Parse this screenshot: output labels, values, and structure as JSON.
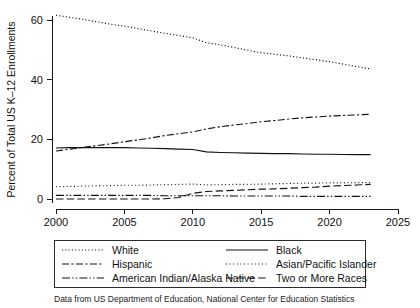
{
  "chart_data": {
    "type": "line",
    "title": "",
    "xlabel": "Year",
    "ylabel": "Percent of Total US K–12 Enrollments",
    "xlim": [
      2000,
      2025
    ],
    "ylim": [
      0,
      63
    ],
    "xticks": [
      2000,
      2005,
      2010,
      2015,
      2020,
      2025
    ],
    "yticks": [
      0,
      20,
      40,
      60
    ],
    "grid": false,
    "legend_position": "bottom",
    "caption": "Data from US Department of Education, National Center for Education Statistics",
    "x": [
      2000,
      2001,
      2002,
      2003,
      2004,
      2005,
      2006,
      2007,
      2008,
      2009,
      2010,
      2011,
      2012,
      2013,
      2014,
      2015,
      2016,
      2017,
      2018,
      2019,
      2020,
      2021,
      2022,
      2023
    ],
    "series": [
      {
        "name": "White",
        "dash": "dotted",
        "values": [
          61.6,
          60.9,
          60.2,
          59.4,
          58.6,
          57.9,
          57.1,
          56.3,
          55.5,
          54.8,
          54.0,
          52.4,
          51.7,
          50.8,
          49.9,
          49.0,
          48.5,
          48.0,
          47.3,
          46.7,
          46.0,
          45.2,
          44.4,
          43.6
        ]
      },
      {
        "name": "Hispanic",
        "dash": "dash-dot",
        "values": [
          16.1,
          16.7,
          17.3,
          17.9,
          18.5,
          19.2,
          19.8,
          20.5,
          21.3,
          21.9,
          22.5,
          23.5,
          24.2,
          24.8,
          25.3,
          25.9,
          26.3,
          26.8,
          27.2,
          27.5,
          27.8,
          28.0,
          28.2,
          28.4
        ]
      },
      {
        "name": "Black",
        "dash": "solid",
        "values": [
          17.1,
          17.2,
          17.2,
          17.2,
          17.2,
          17.2,
          17.1,
          17.0,
          16.9,
          16.7,
          16.6,
          15.8,
          15.6,
          15.5,
          15.4,
          15.3,
          15.2,
          15.2,
          15.1,
          15.0,
          15.0,
          14.9,
          14.9,
          14.9
        ]
      },
      {
        "name": "Asian/Pacific Islander",
        "dash": "fine-dotted",
        "values": [
          4.1,
          4.2,
          4.3,
          4.4,
          4.5,
          4.6,
          4.6,
          4.7,
          4.8,
          4.9,
          5.0,
          4.7,
          4.8,
          4.9,
          4.9,
          5.0,
          5.1,
          5.2,
          5.3,
          5.3,
          5.4,
          5.4,
          5.5,
          5.5
        ]
      },
      {
        "name": "American Indian/Alaska Native",
        "dash": "dash-dot-dot",
        "values": [
          1.2,
          1.2,
          1.2,
          1.2,
          1.2,
          1.2,
          1.2,
          1.2,
          1.1,
          1.1,
          1.1,
          1.1,
          1.1,
          1.0,
          1.0,
          1.0,
          1.0,
          1.0,
          0.9,
          0.9,
          0.9,
          0.9,
          0.9,
          0.9
        ]
      },
      {
        "name": "Two or More Races",
        "dash": "long-dash",
        "values": [
          0.0,
          0.0,
          0.0,
          0.0,
          0.0,
          0.0,
          0.0,
          0.0,
          0.1,
          0.5,
          1.9,
          2.5,
          2.7,
          2.9,
          3.1,
          3.3,
          3.4,
          3.6,
          3.8,
          4.0,
          4.3,
          4.5,
          4.7,
          4.9
        ]
      }
    ]
  },
  "legend": {
    "entries": [
      {
        "label": "White",
        "key": "dotted"
      },
      {
        "label": "Black",
        "key": "solid"
      },
      {
        "label": "Hispanic",
        "key": "dash-dot"
      },
      {
        "label": "Asian/Pacific Islander",
        "key": "fine-dotted"
      },
      {
        "label": "American Indian/Alaska Native",
        "key": "dash-dot-dot"
      },
      {
        "label": "Two or More Races",
        "key": "long-dash"
      }
    ]
  },
  "axes": {
    "x_title": "Year",
    "y_title": "Percent of Total US K–12 Enrollments",
    "x_tick_labels": [
      "2000",
      "2005",
      "2010",
      "2015",
      "2020",
      "2025"
    ],
    "y_tick_labels": [
      "0",
      "20",
      "40",
      "60"
    ]
  },
  "caption": {
    "text": "Data from US Department of Education, National Center for Education Statistics"
  },
  "colors": {
    "ink": "#121212",
    "background": "#ffffff"
  }
}
